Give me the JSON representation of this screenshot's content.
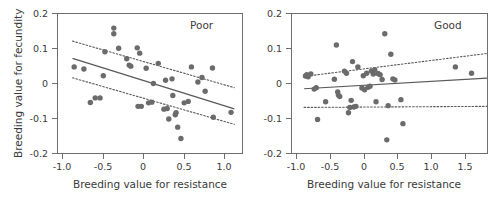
{
  "figure": {
    "background_color": "#ffffff",
    "axis_color": "#6f6f6f",
    "point_color": "#6b6b6b",
    "line_color": "#595959",
    "ci_color": "#5a5a5a",
    "width": 498,
    "height": 200
  },
  "chart_data": [
    {
      "type": "scatter",
      "title": "Poor",
      "xlabel": "Breeding value for resistance",
      "ylabel": "Breeding value for fecundity",
      "xlim": [
        -1.18,
        1.12
      ],
      "ylim": [
        -0.2,
        0.2
      ],
      "xticks": [
        -1.0,
        -0.5,
        0,
        0.5,
        1.0
      ],
      "xtick_labels": [
        "-1.0",
        "-0.5",
        "0",
        "0.5",
        "1.0"
      ],
      "yticks": [
        -0.2,
        -0.1,
        0,
        0.1,
        0.2
      ],
      "ytick_labels": [
        "-0.2",
        "-0.1",
        "0",
        "0.1",
        "0.2"
      ],
      "grid": false,
      "legend": "none",
      "points": [
        [
          -0.98,
          0.05
        ],
        [
          -0.86,
          0.044
        ],
        [
          -0.78,
          -0.051
        ],
        [
          -0.72,
          -0.038
        ],
        [
          -0.66,
          -0.038
        ],
        [
          -0.62,
          0.025
        ],
        [
          -0.6,
          0.093
        ],
        [
          -0.49,
          0.16
        ],
        [
          -0.49,
          0.144
        ],
        [
          -0.43,
          0.103
        ],
        [
          -0.33,
          0.073
        ],
        [
          -0.3,
          0.055
        ],
        [
          -0.28,
          0.052
        ],
        [
          -0.2,
          0.104
        ],
        [
          -0.19,
          -0.062
        ],
        [
          -0.17,
          0.089
        ],
        [
          -0.15,
          -0.062
        ],
        [
          -0.09,
          0.046
        ],
        [
          -0.06,
          -0.052
        ],
        [
          -0.02,
          -0.05
        ],
        [
          0.0,
          0.003
        ],
        [
          0.06,
          0.06
        ],
        [
          0.13,
          -0.07
        ],
        [
          0.15,
          0.012
        ],
        [
          0.17,
          -0.068
        ],
        [
          0.19,
          -0.098
        ],
        [
          0.23,
          0.016
        ],
        [
          0.24,
          -0.031
        ],
        [
          0.27,
          -0.086
        ],
        [
          0.28,
          -0.08
        ],
        [
          0.3,
          -0.121
        ],
        [
          0.34,
          -0.153
        ],
        [
          0.38,
          -0.052
        ],
        [
          0.43,
          -0.048
        ],
        [
          0.47,
          0.05
        ],
        [
          0.55,
          0.007
        ],
        [
          0.6,
          0.02
        ],
        [
          0.64,
          -0.019
        ],
        [
          0.73,
          0.047
        ],
        [
          0.74,
          -0.093
        ],
        [
          0.96,
          -0.079
        ]
      ],
      "fit_line": {
        "x": [
          -1.0,
          1.0
        ],
        "y": [
          0.074,
          -0.069
        ]
      },
      "ci_upper": {
        "x": [
          -1.0,
          1.0
        ],
        "y": [
          0.123,
          -0.009
        ]
      },
      "ci_lower": {
        "x": [
          -1.0,
          1.0
        ],
        "y": [
          0.019,
          -0.113
        ]
      }
    },
    {
      "type": "scatter",
      "title": "Good",
      "xlabel": "Breeding value for resistance",
      "ylabel": "Breeding value for fecundity",
      "xlim": [
        -1.18,
        1.75
      ],
      "ylim": [
        -0.2,
        0.2
      ],
      "xticks": [
        -1.0,
        -0.5,
        0,
        0.5,
        1.0,
        1.5
      ],
      "xtick_labels": [
        "-1.0",
        "-0.5",
        "0",
        "0.5",
        "1.0",
        "1.5"
      ],
      "yticks": [
        -0.2,
        -0.1,
        0,
        0.1,
        0.2
      ],
      "ytick_labels": [
        "-0.2",
        "-0.1",
        "0",
        "0.1",
        "0.2"
      ],
      "grid": false,
      "legend": "none",
      "points": [
        [
          -0.98,
          0.024
        ],
        [
          -0.96,
          0.028
        ],
        [
          -0.94,
          0.022
        ],
        [
          -0.9,
          0.03
        ],
        [
          -0.85,
          -0.013
        ],
        [
          -0.82,
          -0.009
        ],
        [
          -0.8,
          -0.099
        ],
        [
          -0.68,
          -0.049
        ],
        [
          -0.55,
          0.015
        ],
        [
          -0.52,
          0.112
        ],
        [
          -0.5,
          -0.021
        ],
        [
          -0.49,
          -0.03
        ],
        [
          -0.47,
          -0.034
        ],
        [
          -0.4,
          0.038
        ],
        [
          -0.37,
          0.032
        ],
        [
          -0.34,
          -0.08
        ],
        [
          -0.32,
          -0.065
        ],
        [
          -0.3,
          -0.045
        ],
        [
          -0.28,
          0.065
        ],
        [
          -0.26,
          -0.064
        ],
        [
          -0.23,
          -0.062
        ],
        [
          -0.2,
          0.05
        ],
        [
          -0.14,
          -0.01
        ],
        [
          -0.12,
          0.025
        ],
        [
          -0.1,
          -0.015
        ],
        [
          -0.07,
          0.032
        ],
        [
          -0.05,
          -0.008
        ],
        [
          -0.02,
          -0.005
        ],
        [
          0.0,
          0.038
        ],
        [
          0.03,
          0.03
        ],
        [
          0.05,
          0.042
        ],
        [
          0.07,
          -0.049
        ],
        [
          0.1,
          0.031
        ],
        [
          0.13,
          0.028
        ],
        [
          0.16,
          0.014
        ],
        [
          0.2,
          0.144
        ],
        [
          0.23,
          -0.157
        ],
        [
          0.25,
          -0.06
        ],
        [
          0.29,
          0.086
        ],
        [
          0.32,
          0.016
        ],
        [
          0.35,
          0.013
        ],
        [
          0.44,
          -0.043
        ],
        [
          0.47,
          -0.111
        ],
        [
          1.25,
          0.05
        ],
        [
          1.49,
          0.032
        ]
      ],
      "fit_line": {
        "x": [
          -1.0,
          1.72
        ],
        "y": [
          -0.012,
          0.018
        ]
      },
      "ci_upper": {
        "x": [
          -1.0,
          1.72
        ],
        "y": [
          0.023,
          0.088
        ]
      },
      "ci_lower": {
        "x": [
          -1.0,
          1.72
        ],
        "y": [
          -0.065,
          -0.062
        ]
      }
    }
  ]
}
